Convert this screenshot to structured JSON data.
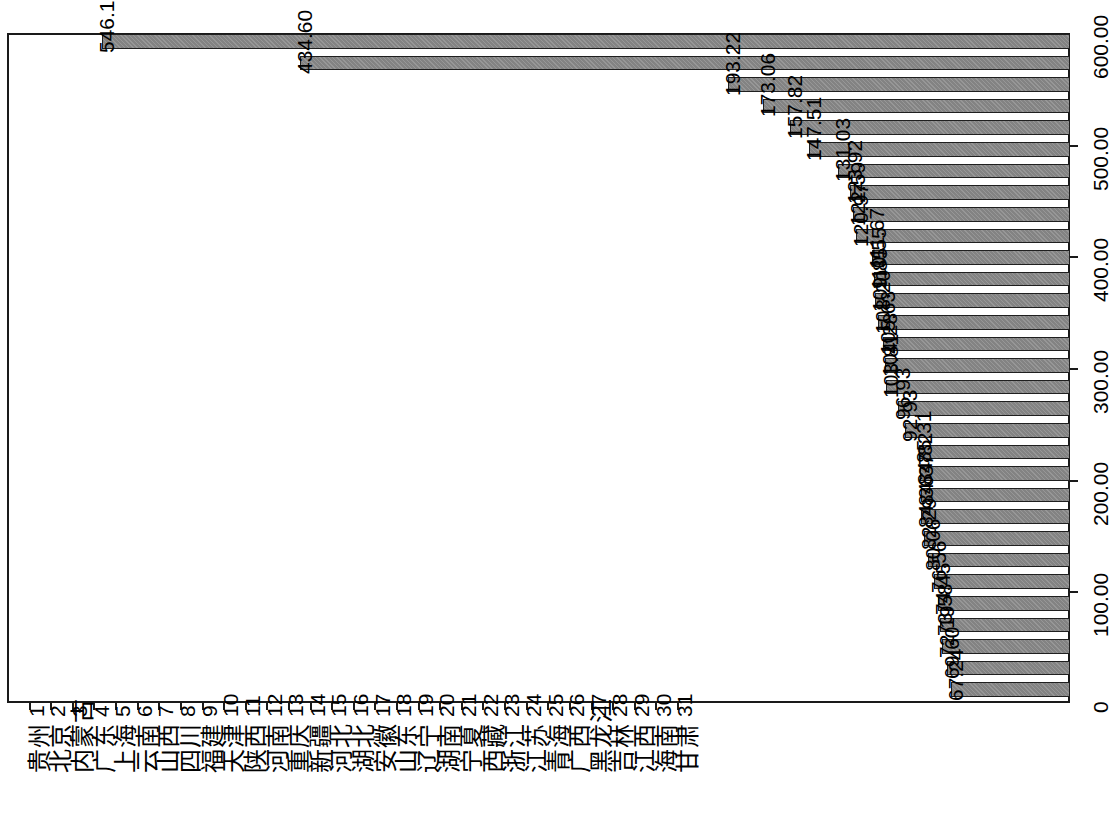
{
  "chart_data": {
    "type": "bar",
    "title": "",
    "subtitle": "",
    "xlabel": "",
    "ylabel": "",
    "orientation": "rotated-90",
    "grid": false,
    "legend": null,
    "ylim": [
      0,
      600
    ],
    "axis_ticks": [
      "0",
      "100.00",
      "200.00",
      "300.00",
      "400.00",
      "500.00",
      "600.00"
    ],
    "axis_tick_values": [
      0,
      100,
      200,
      300,
      400,
      500,
      600
    ],
    "categories": [
      "贵州",
      "北京",
      "内蒙古",
      "广东",
      "上海",
      "云南",
      "山西",
      "四川",
      "福建",
      "天津",
      "陕西",
      "河南",
      "重庆",
      "新疆",
      "河北",
      "湖北",
      "安徽",
      "山东",
      "辽宁",
      "湖南",
      "宁夏",
      "西藏",
      "浙江",
      "江苏",
      "青海",
      "广西",
      "黑龙江",
      "吉林",
      "江西",
      "海南",
      "甘肃"
    ],
    "indices": [
      "1",
      "2",
      "3",
      "4",
      "5",
      "6",
      "7",
      "8",
      "9",
      "10",
      "11",
      "12",
      "13",
      "14",
      "15",
      "16",
      "17",
      "18",
      "19",
      "20",
      "21",
      "22",
      "23",
      "24",
      "25",
      "26",
      "27",
      "28",
      "29",
      "30",
      "31"
    ],
    "values": [
      546.18,
      434.6,
      193.22,
      173.06,
      157.82,
      147.51,
      131.03,
      123.92,
      122.59,
      120.97,
      111.67,
      110.55,
      109.85,
      108.2,
      105.63,
      104.28,
      103.81,
      96.93,
      92.93,
      85.31,
      84.82,
      84.37,
      84.36,
      82.29,
      80.06,
      76.56,
      74.45,
      73.58,
      72.19,
      69.6,
      67.24
    ],
    "value_labels": [
      "546.18",
      "434.60",
      "193.22",
      "173.06",
      "157.82",
      "147.51",
      "131.03",
      "123.92",
      "122.59",
      "120.97",
      "111.67",
      "110.55",
      "109.85",
      "108.20",
      "105.63",
      "104.28",
      "103.81",
      "96.93",
      "92.93",
      "85.31",
      "84.82",
      "84.37",
      "84.36",
      "82.29",
      "80.06",
      "76.56",
      "74.45",
      "73.58",
      "72.19",
      "69.60",
      "67.24"
    ],
    "colors": {
      "bar_fill": "#838383",
      "bar_border": "#1f1f1f",
      "axis": "#1a1a1a",
      "background": "#ffffff",
      "text": "#000000"
    }
  }
}
